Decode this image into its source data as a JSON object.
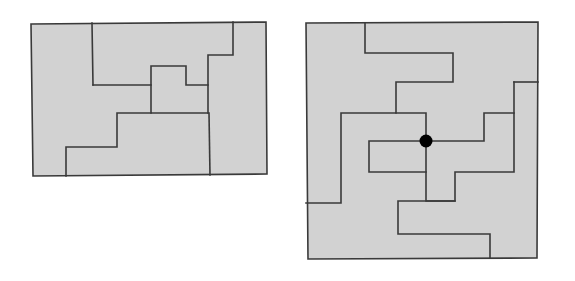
{
  "page": {
    "background_color": "#ffffff",
    "width": 575,
    "height": 281
  },
  "style": {
    "fill_color": "#d2d2d2",
    "stroke_color": "#3a3a3a",
    "outer_stroke_color": "#3a3a3a",
    "dot_color": "#000000",
    "outer_stroke_width": 1.6,
    "inner_stroke_width": 1.6
  },
  "figures": [
    {
      "id": "left-figure",
      "name": "rectangle-dissection",
      "label": "",
      "outline": [
        [
          31,
          24
        ],
        [
          266,
          22
        ],
        [
          267,
          174
        ],
        [
          33,
          176
        ]
      ],
      "cut_lines": [
        {
          "name": "cut-left-vertical",
          "points": [
            [
              92,
              23
            ],
            [
              93,
              85
            ]
          ]
        },
        {
          "name": "cut-upper-staircase",
          "points": [
            [
              93,
              85
            ],
            [
              151,
              85
            ],
            [
              151,
              66
            ],
            [
              186,
              66
            ],
            [
              186,
              85
            ],
            [
              208,
              85
            ]
          ]
        },
        {
          "name": "cut-right-step",
          "points": [
            [
              233,
              22
            ],
            [
              233,
              55
            ],
            [
              208,
              55
            ],
            [
              208,
              113
            ]
          ]
        },
        {
          "name": "cut-mid-horizontal",
          "points": [
            [
              208,
              113
            ],
            [
              151,
              113
            ],
            [
              151,
              85
            ]
          ]
        },
        {
          "name": "cut-lower-staircase",
          "points": [
            [
              151,
              113
            ],
            [
              117,
              113
            ],
            [
              117,
              147
            ],
            [
              66,
              147
            ],
            [
              66,
              176
            ]
          ]
        },
        {
          "name": "cut-right-vertical",
          "points": [
            [
              209,
              113
            ],
            [
              210,
              175
            ]
          ]
        }
      ],
      "dots": []
    },
    {
      "id": "right-figure",
      "name": "spiral-dissection",
      "label": "",
      "outline": [
        [
          306,
          23
        ],
        [
          538,
          22
        ],
        [
          537,
          258
        ],
        [
          308,
          259
        ]
      ],
      "cut_lines": [
        {
          "name": "spiral-arm-outer-top",
          "points": [
            [
              365,
              23
            ],
            [
              365,
              53
            ],
            [
              453,
              53
            ],
            [
              453,
              82
            ],
            [
              396,
              82
            ],
            [
              396,
              113
            ],
            [
              341,
              113
            ],
            [
              341,
              203
            ],
            [
              306,
              203
            ]
          ]
        },
        {
          "name": "spiral-arm-inner-upper",
          "points": [
            [
              396,
              113
            ],
            [
              426,
              113
            ],
            [
              426,
              141
            ]
          ]
        },
        {
          "name": "spiral-arm-inner-right",
          "points": [
            [
              426,
              141
            ],
            [
              484,
              141
            ],
            [
              484,
              113
            ],
            [
              514,
              113
            ],
            [
              514,
              172
            ],
            [
              455,
              172
            ],
            [
              455,
              201
            ],
            [
              426,
              201
            ],
            [
              426,
              141
            ]
          ]
        },
        {
          "name": "spiral-arm-inner-left",
          "points": [
            [
              426,
              141
            ],
            [
              369,
              141
            ],
            [
              369,
              172
            ],
            [
              426,
              172
            ]
          ]
        },
        {
          "name": "spiral-arm-lower",
          "points": [
            [
              455,
              201
            ],
            [
              398,
              201
            ],
            [
              398,
              234
            ],
            [
              490,
              234
            ],
            [
              490,
              258
            ]
          ]
        },
        {
          "name": "notch-right-upper",
          "points": [
            [
              514,
              82
            ],
            [
              514,
              113
            ]
          ]
        },
        {
          "name": "notch-right-top",
          "points": [
            [
              514,
              82
            ],
            [
              538,
              82
            ]
          ]
        }
      ],
      "dots": [
        {
          "name": "center-marker",
          "cx": 426,
          "cy": 141,
          "r": 6.5
        }
      ]
    }
  ]
}
